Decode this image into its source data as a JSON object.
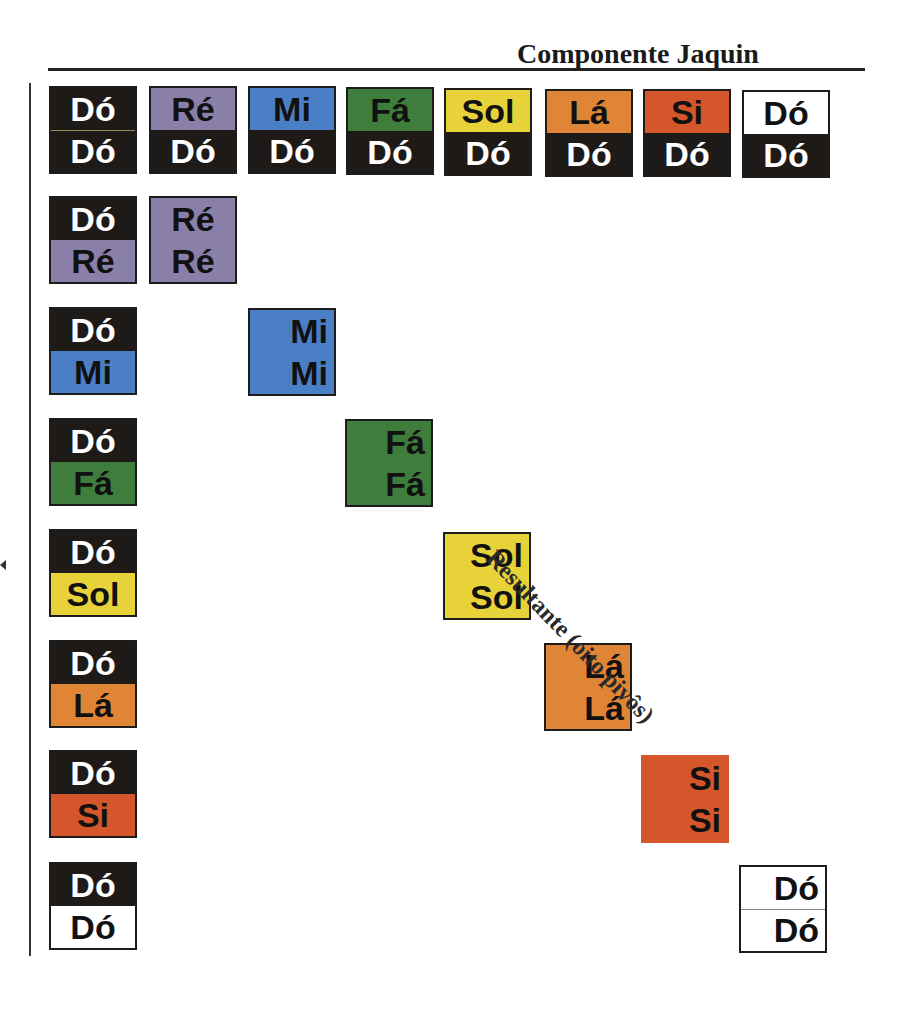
{
  "title": "Componente Jaquin",
  "diagonal_label": "Resultante (oito pivôs)",
  "colors": {
    "black": "#1e1a17",
    "re": "#8a7fa8",
    "mi": "#4a7fc6",
    "fa": "#3f7d3c",
    "sol": "#e8d23a",
    "la": "#e08436",
    "si": "#d4562a",
    "white": "#ffffff"
  },
  "top_row": [
    {
      "top": "Dó",
      "bottom": "Dó",
      "top_color": "black",
      "bottom_color": "black"
    },
    {
      "top": "Ré",
      "bottom": "Dó",
      "top_color": "re",
      "bottom_color": "black"
    },
    {
      "top": "Mi",
      "bottom": "Dó",
      "top_color": "mi",
      "bottom_color": "black"
    },
    {
      "top": "Fá",
      "bottom": "Dó",
      "top_color": "fa",
      "bottom_color": "black"
    },
    {
      "top": "Sol",
      "bottom": "Dó",
      "top_color": "sol",
      "bottom_color": "black"
    },
    {
      "top": "Lá",
      "bottom": "Dó",
      "top_color": "la",
      "bottom_color": "black"
    },
    {
      "top": "Si",
      "bottom": "Dó",
      "top_color": "si",
      "bottom_color": "black"
    },
    {
      "top": "Dó",
      "bottom": "Dó",
      "top_color": "white",
      "bottom_color": "black"
    }
  ],
  "left_column": [
    {
      "top": "Dó",
      "bottom": "Ré",
      "top_color": "black",
      "bottom_color": "re"
    },
    {
      "top": "Dó",
      "bottom": "Mi",
      "top_color": "black",
      "bottom_color": "mi"
    },
    {
      "top": "Dó",
      "bottom": "Fá",
      "top_color": "black",
      "bottom_color": "fa"
    },
    {
      "top": "Dó",
      "bottom": "Sol",
      "top_color": "black",
      "bottom_color": "sol"
    },
    {
      "top": "Dó",
      "bottom": "Lá",
      "top_color": "black",
      "bottom_color": "la"
    },
    {
      "top": "Dó",
      "bottom": "Si",
      "top_color": "black",
      "bottom_color": "si"
    },
    {
      "top": "Dó",
      "bottom": "Dó",
      "top_color": "black",
      "bottom_color": "white"
    }
  ],
  "diagonal": [
    {
      "top": "Ré",
      "bottom": "Ré",
      "color": "re"
    },
    {
      "top": "Mi",
      "bottom": "Mi",
      "color": "mi"
    },
    {
      "top": "Fá",
      "bottom": "Fá",
      "color": "fa"
    },
    {
      "top": "Sol",
      "bottom": "Sol",
      "color": "sol"
    },
    {
      "top": "Lá",
      "bottom": "Lá",
      "color": "la"
    },
    {
      "top": "Si",
      "bottom": "Si",
      "color": "si"
    },
    {
      "top": "Dó",
      "bottom": "Dó",
      "color": "white"
    }
  ]
}
